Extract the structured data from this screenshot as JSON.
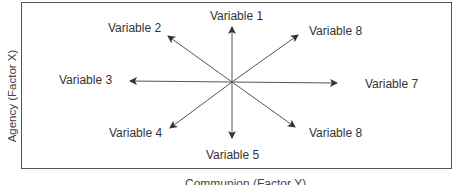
{
  "diagram": {
    "y_axis_label": "Agency (Factor X)",
    "x_axis_label": "Communion (Factor Y)",
    "variables": [
      {
        "label": "Variable 1",
        "direction": "up"
      },
      {
        "label": "Variable 2",
        "direction": "up-left"
      },
      {
        "label": "Variable 3",
        "direction": "left"
      },
      {
        "label": "Variable 4",
        "direction": "down-left"
      },
      {
        "label": "Variable 5",
        "direction": "down"
      },
      {
        "label": "Variable 8",
        "direction": "down-right"
      },
      {
        "label": "Variable 7",
        "direction": "right"
      },
      {
        "label": "Variable 8",
        "direction": "up-right"
      }
    ],
    "line_color": "#555555"
  }
}
